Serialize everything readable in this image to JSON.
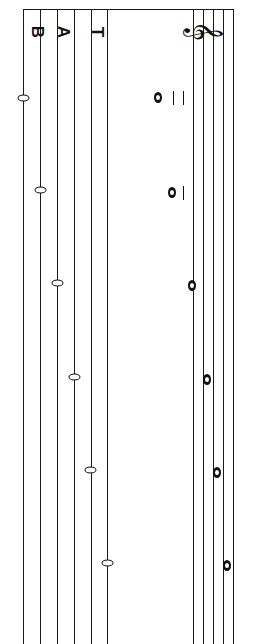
{
  "notation": {
    "orientation": "rotated-90",
    "clef": "treble-clef",
    "clef_glyph": "𝄞",
    "tab_label": [
      "T",
      "A",
      "B"
    ],
    "staff_lines_x": [
      193,
      203,
      213,
      223,
      233
    ],
    "tab_lines_x": [
      23,
      40,
      57,
      74,
      91,
      107
    ],
    "notes": [
      {
        "y": 98,
        "x": 157,
        "ledger_lines": 2
      },
      {
        "y": 192,
        "x": 171,
        "ledger_lines": 1
      },
      {
        "y": 286,
        "x": 191,
        "ledger_lines": 0
      },
      {
        "y": 379,
        "x": 204,
        "ledger_lines": 0
      },
      {
        "y": 473,
        "x": 214,
        "ledger_lines": 0
      },
      {
        "y": 566,
        "x": 224,
        "ledger_lines": 0
      }
    ],
    "tab_frets": [
      {
        "string": 6,
        "fret": "0",
        "y": 98,
        "x": 20
      },
      {
        "string": 5,
        "fret": "0",
        "y": 190,
        "x": 37
      },
      {
        "string": 4,
        "fret": "0",
        "y": 283,
        "x": 54
      },
      {
        "string": 3,
        "fret": "0",
        "y": 377,
        "x": 71
      },
      {
        "string": 2,
        "fret": "0",
        "y": 470,
        "x": 87
      },
      {
        "string": 1,
        "fret": "0",
        "y": 563,
        "x": 104
      }
    ]
  }
}
